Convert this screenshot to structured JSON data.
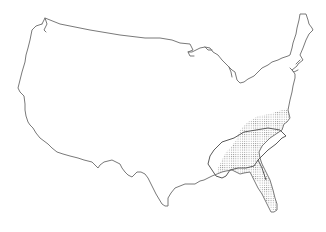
{
  "map": {
    "subject": "Continental United States outline",
    "shaded_region_label": "Southeastern United States range",
    "colors": {
      "background": "#ffffff",
      "outline": "#6a6a6a",
      "stipple": "#9a9a9a"
    }
  }
}
